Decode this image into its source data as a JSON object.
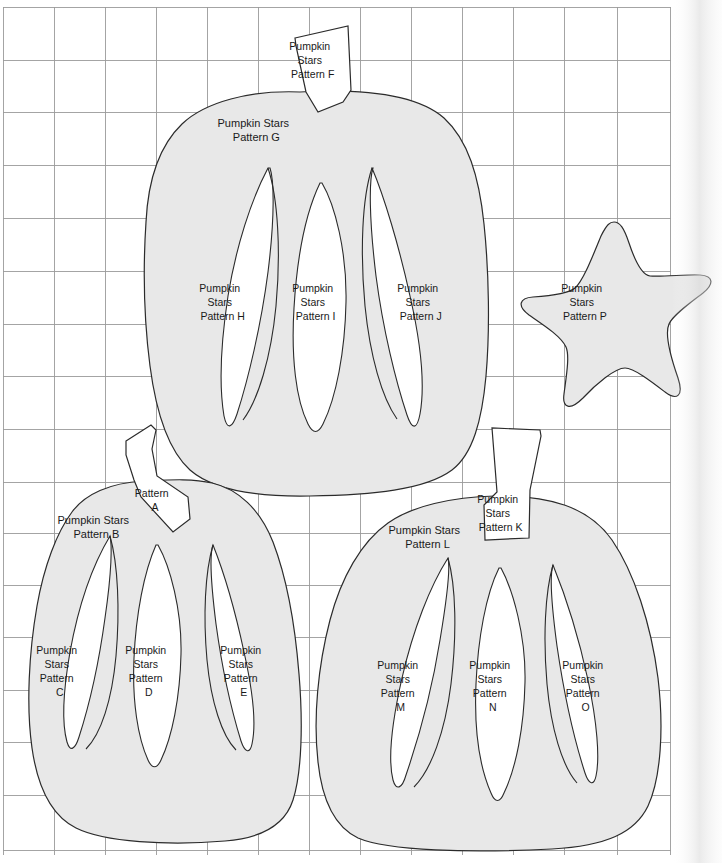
{
  "document": {
    "title": "Pumpkin Stars Pattern Sheet",
    "sheet_width": 722,
    "sheet_height": 863,
    "background_color": "#ffffff",
    "piece_fill_color": "#e8e8e8",
    "piece_stroke_color": "#2b2b2b",
    "grid_color": "#9a9a9a",
    "text_color": "#1a1a1a",
    "grid": {
      "origin_x": 3,
      "origin_y": 7,
      "cell_width": 51,
      "cell_height": 52.5,
      "columns": 13,
      "rows": 16,
      "right_edge_x": 670,
      "bottom_edge_y": 850
    }
  },
  "pieces": {
    "stem_f": {
      "name": "Pumpkin Stars Pattern F",
      "line1": "Pumpkin",
      "line2": "Stars",
      "line3": "Pattern F",
      "shape": "stem",
      "label_x": 320,
      "label_y": 45
    },
    "body_g": {
      "name": "Pumpkin Stars Pattern G",
      "line1": "Pumpkin Stars",
      "line2": "Pattern G",
      "shape": "pumpkin-body",
      "label_x": 264,
      "label_y": 124
    },
    "rib_h": {
      "name": "Pumpkin Stars Pattern H",
      "line1": "Pumpkin",
      "line2": "Stars",
      "line3": "Pattern H",
      "shape": "rib",
      "label_x": 230,
      "label_y": 289
    },
    "rib_i": {
      "name": "Pumpkin Stars Pattern I",
      "line1": "Pumpkin",
      "line2": "Stars",
      "line3": "Pattern I",
      "shape": "rib",
      "label_x": 323,
      "label_y": 289
    },
    "rib_j": {
      "name": "Pumpkin Stars Pattern J",
      "line1": "Pumpkin",
      "line2": "Stars",
      "line3": "Pattern J",
      "shape": "rib",
      "label_x": 428,
      "label_y": 289
    },
    "star_p": {
      "name": "Pumpkin Stars Pattern P",
      "line1": "Pumpkin",
      "line2": "Stars",
      "line3": "Pattern P",
      "shape": "star",
      "label_x": 592,
      "label_y": 293
    },
    "stem_a": {
      "name": "Pattern A",
      "line1": "Pattern",
      "line2": "A",
      "shape": "stem",
      "label_x": 162,
      "label_y": 494
    },
    "body_b": {
      "name": "Pumpkin Stars Pattern B",
      "line1": "Pumpkin Stars",
      "line2": "Pattern B",
      "shape": "pumpkin-body",
      "label_x": 104,
      "label_y": 521
    },
    "rib_c": {
      "name": "Pumpkin Stars Pattern C",
      "line1": "Pumpkin",
      "line2": "Stars",
      "line3": "Pattern",
      "line4": "C",
      "shape": "rib",
      "label_x": 67,
      "label_y": 653
    },
    "rib_d": {
      "name": "Pumpkin Stars Pattern D",
      "line1": "Pumpkin",
      "line2": "Stars",
      "line3": "Pattern",
      "line4": "D",
      "shape": "rib",
      "label_x": 156,
      "label_y": 653
    },
    "rib_e": {
      "name": "Pumpkin Stars Pattern E",
      "line1": "Pumpkin",
      "line2": "Stars",
      "line3": "Pattern",
      "line4": "E",
      "shape": "rib",
      "label_x": 251,
      "label_y": 653
    },
    "stem_k": {
      "name": "Pumpkin Stars Pattern K",
      "line1": "Pumpkin",
      "line2": "Stars",
      "line3": "Pattern K",
      "shape": "stem",
      "label_x": 507,
      "label_y": 505
    },
    "body_l": {
      "name": "Pumpkin Stars Pattern L",
      "line1": "Pumpkin Stars",
      "line2": "Pattern L",
      "shape": "pumpkin-body",
      "label_x": 435,
      "label_y": 534
    },
    "rib_m": {
      "name": "Pumpkin Stars Pattern M",
      "line1": "Pumpkin",
      "line2": "Stars",
      "line3": "Pattern",
      "line4": "M",
      "shape": "rib",
      "label_x": 408,
      "label_y": 668
    },
    "rib_n": {
      "name": "Pumpkin Stars Pattern N",
      "line1": "Pumpkin",
      "line2": "Stars",
      "line3": "Pattern",
      "line4": "N",
      "shape": "rib",
      "label_x": 500,
      "label_y": 668
    },
    "rib_o": {
      "name": "Pumpkin Stars Pattern O",
      "line1": "Pumpkin",
      "line2": "Stars",
      "line3": "Pattern",
      "line4": "O",
      "shape": "rib",
      "label_x": 593,
      "label_y": 668
    }
  }
}
